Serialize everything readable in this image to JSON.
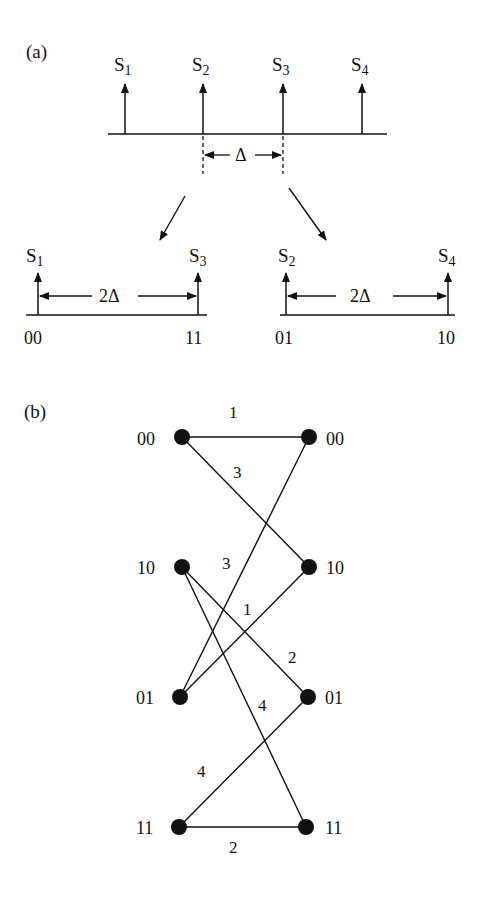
{
  "panel_a": {
    "label": "(a)",
    "top_signals": [
      {
        "name": "S",
        "sub": "1"
      },
      {
        "name": "S",
        "sub": "2"
      },
      {
        "name": "S",
        "sub": "3"
      },
      {
        "name": "S",
        "sub": "4"
      }
    ],
    "delta_label": "Δ",
    "left_sub": {
      "signals": [
        {
          "name": "S",
          "sub": "1"
        },
        {
          "name": "S",
          "sub": "3"
        }
      ],
      "spacing_label": "2Δ",
      "bit_labels": [
        "00",
        "11"
      ]
    },
    "right_sub": {
      "signals": [
        {
          "name": "S",
          "sub": "2"
        },
        {
          "name": "S",
          "sub": "4"
        }
      ],
      "spacing_label": "2Δ",
      "bit_labels": [
        "01",
        "10"
      ]
    }
  },
  "panel_b": {
    "label": "(b)",
    "left_nodes": [
      "00",
      "10",
      "01",
      "11"
    ],
    "right_nodes": [
      "00",
      "10",
      "01",
      "11"
    ],
    "edges": [
      {
        "from": "00",
        "to": "00",
        "weight": "1"
      },
      {
        "from": "00",
        "to": "10",
        "weight": "3"
      },
      {
        "from": "10",
        "to": "01",
        "weight": "2"
      },
      {
        "from": "10",
        "to": "11",
        "weight": "4"
      },
      {
        "from": "01",
        "to": "00",
        "weight": "3"
      },
      {
        "from": "01",
        "to": "10",
        "weight": "1"
      },
      {
        "from": "11",
        "to": "01",
        "weight": "4"
      },
      {
        "from": "11",
        "to": "11",
        "weight": "2"
      }
    ]
  }
}
